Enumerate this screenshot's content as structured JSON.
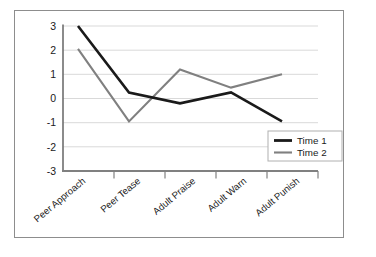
{
  "chart_data": {
    "type": "line",
    "title": "",
    "xlabel": "",
    "ylabel": "",
    "categories": [
      "Peer Approach",
      "Peer Tease",
      "Adult Praise",
      "Adult Warn",
      "Adult Punish"
    ],
    "series": [
      {
        "name": "Time 1",
        "values": [
          3,
          0.25,
          -0.2,
          0.25,
          -0.95
        ],
        "color": "#1a1a1a"
      },
      {
        "name": "Time 2",
        "values": [
          2.05,
          -0.95,
          1.2,
          0.45,
          1
        ],
        "color": "#808080"
      }
    ],
    "ylim": [
      -3,
      3
    ],
    "yticks": [
      "3",
      "2",
      "1",
      "0",
      "-1",
      "-2",
      "-3"
    ],
    "ytick_values": [
      3,
      2,
      1,
      0,
      -1,
      -2,
      -3
    ],
    "grid": "horizontal",
    "legend_position": "bottom-right",
    "legend_entries": [
      "Time 1",
      "Time 2"
    ],
    "colors": {
      "series_1": "#1a1a1a",
      "series_2": "#808080",
      "gridline": "#d9d9d9",
      "axis": "#808080",
      "frame": "#8d8d8d",
      "background": "#ffffff"
    }
  }
}
